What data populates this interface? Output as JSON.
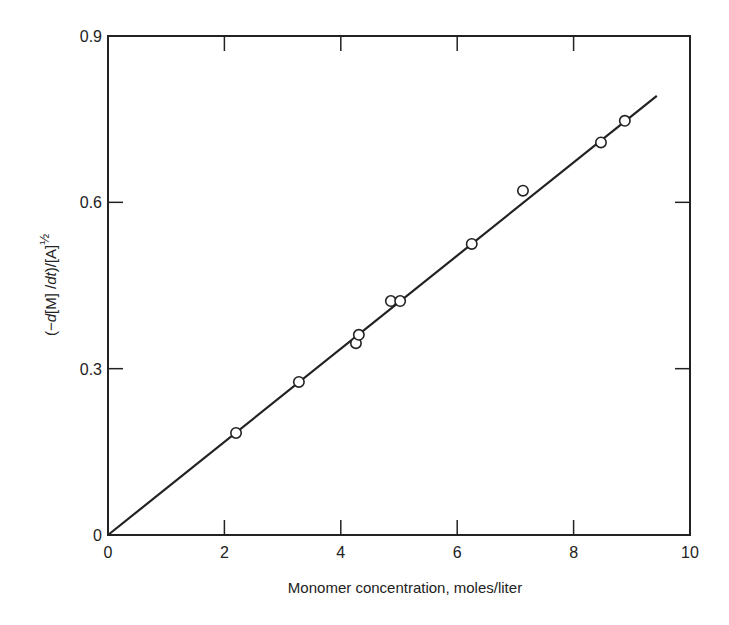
{
  "chart_data": {
    "type": "scatter",
    "title": "",
    "xlabel": "Monomer concentration, moles/liter",
    "ylabel": "(−d[M]/dt)/[A]½",
    "ylabel_parts": {
      "open": "(−",
      "d": "d",
      "m": "[M] /",
      "dt": "dt",
      "close": ")/[A]",
      "exponent": "½"
    },
    "xlim": [
      0,
      10
    ],
    "ylim": [
      0,
      0.9
    ],
    "x_ticks": [
      0,
      2,
      4,
      6,
      8,
      10
    ],
    "x_tick_labels": [
      "0",
      "2",
      "4",
      "6",
      "8",
      "10"
    ],
    "y_ticks": [
      0,
      0.3,
      0.6,
      0.9
    ],
    "y_tick_labels": [
      "0",
      "0.3",
      "0.6",
      "0.9"
    ],
    "grid": false,
    "legend": null,
    "series": [
      {
        "name": "data",
        "marker": "open-circle",
        "x": [
          2.2,
          3.28,
          4.26,
          4.31,
          4.86,
          5.02,
          6.25,
          7.13,
          8.47,
          8.88
        ],
        "y": [
          0.184,
          0.276,
          0.346,
          0.361,
          0.422,
          0.422,
          0.525,
          0.621,
          0.708,
          0.747
        ]
      },
      {
        "name": "fit line",
        "type": "line",
        "x": [
          0,
          9.43
        ],
        "y": [
          0,
          0.792
        ]
      }
    ]
  },
  "colors": {
    "ink": "#222222",
    "background": "#ffffff"
  }
}
